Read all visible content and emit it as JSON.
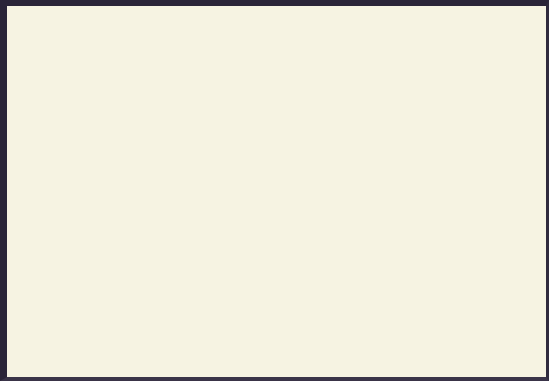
{
  "chart_data": {
    "type": "bar",
    "title": "",
    "subtitle": "",
    "xlabel": "",
    "ylabel": "",
    "ylim": [
      0,
      10
    ],
    "y_ticks": [
      0,
      1,
      2,
      3,
      4,
      5,
      6,
      7,
      8,
      9,
      10
    ],
    "grid": true,
    "legend": "none",
    "categories": [
      "SAVM",
      "Dam",
      "Der",
      "VaR",
      "IFr",
      "RoR",
      "NaA",
      "MMe",
      "MVe",
      "MHo",
      "MPr",
      "MM"
    ],
    "values": [
      6.8,
      6.05,
      4.9,
      4.8,
      6.9,
      4.35,
      4.85,
      7.7,
      6.7,
      8.2,
      7.7,
      9.95
    ],
    "colors": [
      "#7dc24b",
      "#f4703a",
      "#c46bbe",
      "#5a9954",
      "#7b7fcb",
      "#8b4a96",
      "#231812",
      "#f5dec0",
      "#f5dc52",
      "#f9bc5e",
      "#f4933e",
      "#8b5a2b"
    ],
    "bar_border_color": "#5a5348",
    "plot_background": "#fbf9ea",
    "page_background": "#f6f3e2",
    "frame_color": "#2a2438",
    "gridline_color": "#cfcdb8"
  }
}
